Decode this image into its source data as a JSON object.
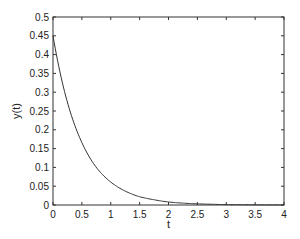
{
  "chart_data": {
    "type": "line",
    "title": "",
    "xlabel": "t",
    "ylabel": "y(t)",
    "xlim": [
      0,
      4
    ],
    "ylim": [
      0,
      0.5
    ],
    "grid": false,
    "legend": null,
    "xticks": [
      "0",
      "0.5",
      "1",
      "1.5",
      "2",
      "2.5",
      "3",
      "3.5",
      "4"
    ],
    "yticks": [
      "0",
      "0.05",
      "0.1",
      "0.15",
      "0.2",
      "0.25",
      "0.3",
      "0.35",
      "0.4",
      "0.45",
      "0.5"
    ],
    "series": [
      {
        "name": "y(t)",
        "color": "#333333",
        "x": [
          0,
          0.25,
          0.5,
          0.75,
          1,
          1.25,
          1.5,
          1.75,
          2,
          2.25,
          2.5,
          2.75,
          3,
          3.25,
          3.5,
          3.75,
          4
        ],
        "y": [
          0.45,
          0.273,
          0.166,
          0.1,
          0.061,
          0.037,
          0.022,
          0.014,
          0.008,
          0.005,
          0.003,
          0.002,
          0.001,
          0.0007,
          0.0004,
          0.0002,
          0.0002
        ]
      }
    ]
  }
}
